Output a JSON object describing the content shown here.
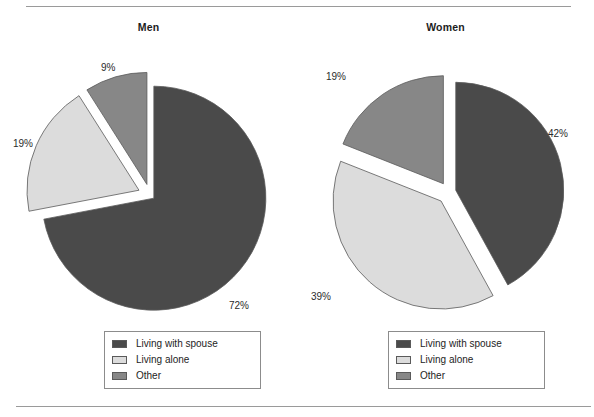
{
  "page": {
    "background": "#ffffff",
    "rule_color": "#9a9a9a"
  },
  "colors": {
    "living_with_spouse": "#4a4a4a",
    "living_alone": "#dcdcdc",
    "other": "#878787",
    "slice_outline": "#5a5a5a",
    "text": "#1d1d1d"
  },
  "charts": [
    {
      "id": "men",
      "title": "Men",
      "labels": [
        "72%",
        "19%",
        "9%"
      ]
    },
    {
      "id": "women",
      "title": "Women",
      "labels": [
        "42%",
        "39%",
        "19%"
      ]
    }
  ],
  "legend": {
    "items": [
      {
        "label": "Living with spouse",
        "color": "#4a4a4a"
      },
      {
        "label": "Living alone",
        "color": "#dcdcdc"
      },
      {
        "label": "Other",
        "color": "#878787"
      }
    ]
  },
  "chart_data": [
    {
      "type": "pie",
      "title": "Men",
      "categories": [
        "Living with spouse",
        "Living alone",
        "Other"
      ],
      "values": [
        72,
        19,
        9
      ],
      "data_labels": [
        "72%",
        "19%",
        "9%"
      ],
      "colors": [
        "#4a4a4a",
        "#dcdcdc",
        "#878787"
      ],
      "exploded": true,
      "start_angle_deg": 0,
      "direction": "clockwise",
      "legend_position": "bottom",
      "xlabel": "",
      "ylabel": ""
    },
    {
      "type": "pie",
      "title": "Women",
      "categories": [
        "Living with spouse",
        "Living alone",
        "Other"
      ],
      "values": [
        42,
        39,
        19
      ],
      "data_labels": [
        "42%",
        "39%",
        "19%"
      ],
      "colors": [
        "#4a4a4a",
        "#dcdcdc",
        "#878787"
      ],
      "exploded": true,
      "start_angle_deg": 0,
      "direction": "clockwise",
      "legend_position": "bottom",
      "xlabel": "",
      "ylabel": ""
    }
  ]
}
